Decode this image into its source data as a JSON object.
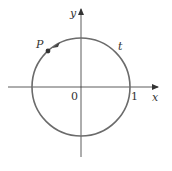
{
  "diagram": {
    "title": "",
    "labels": {
      "x_axis": "x",
      "y_axis": "y",
      "origin": "0",
      "one": "1",
      "point": "P",
      "arc": "t"
    },
    "colors": {
      "circle": "#6b6b6b",
      "axes": "#333333",
      "point": "#333333"
    }
  }
}
